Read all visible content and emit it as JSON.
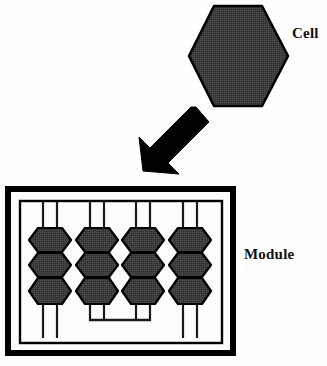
{
  "diagram": {
    "title_present": false,
    "labels": {
      "cell": "Cell",
      "module": "Module"
    },
    "colors": {
      "cell_fill": "#3c3c3c",
      "cell_stroke": "#000000",
      "frame_stroke": "#000000",
      "wire_stroke": "#1a1a1a",
      "arrow_fill": "#000000",
      "background": "#fefefe",
      "module_interior": "#fdfdfd"
    },
    "cell_shape": {
      "type": "hexagon",
      "orientation": "flat-top",
      "center_x": 238,
      "center_y": 56,
      "width": 96,
      "height": 100,
      "stroke_width": 2.5
    },
    "arrow": {
      "direction": "down-left",
      "from_x": 206,
      "from_y": 114,
      "to_x": 145,
      "to_y": 170,
      "shaft_width": 17,
      "head_width": 36,
      "head_length": 30
    },
    "module": {
      "outer_frame": {
        "x": 5,
        "y": 186,
        "width": 231,
        "height": 170,
        "stroke_width": 6
      },
      "inner_frame": {
        "x": 19,
        "y": 200,
        "width": 204,
        "height": 144,
        "stroke_width": 2.5
      },
      "columns": 4,
      "cells_per_column": 3,
      "column_centers": [
        50,
        97,
        143,
        190
      ],
      "cell_width": 42,
      "cell_height": 27,
      "cell_rows_y": [
        240,
        265,
        290
      ],
      "wire_offset": 7,
      "wire_top_y": 202,
      "wire_bottom_y": 338,
      "bottom_connector": {
        "present": true,
        "from_column": 2,
        "to_column": 3,
        "y": 320,
        "x_start": 90,
        "x_end": 150
      }
    }
  }
}
